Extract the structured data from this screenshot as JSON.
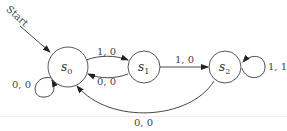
{
  "diagram": {
    "type": "finite-state-machine",
    "start_label": "Start",
    "states": [
      {
        "id": "s0",
        "base": "s",
        "sub": "0"
      },
      {
        "id": "s1",
        "base": "s",
        "sub": "1"
      },
      {
        "id": "s2",
        "base": "s",
        "sub": "2"
      }
    ],
    "transitions": [
      {
        "from": "s0",
        "to": "s0",
        "label": "0, 0"
      },
      {
        "from": "s0",
        "to": "s1",
        "label": "1, 0"
      },
      {
        "from": "s1",
        "to": "s0",
        "label": "0, 0"
      },
      {
        "from": "s1",
        "to": "s2",
        "label": "1, 0"
      },
      {
        "from": "s2",
        "to": "s2",
        "label": "1, 1"
      },
      {
        "from": "s2",
        "to": "s0",
        "label": "0, 0"
      }
    ]
  }
}
